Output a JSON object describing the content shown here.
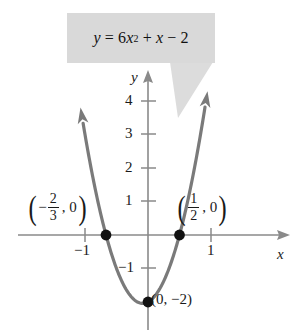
{
  "figure": {
    "equation_label": {
      "lhs": "y",
      "equals": "=",
      "coefficient": "6",
      "variable": "x",
      "exponent": "2",
      "plus": "+",
      "linear_term": "x",
      "minus": "−",
      "constant": "2",
      "full_text": "y = 6x² + x − 2",
      "box_color": "#d9d9d9"
    },
    "axes": {
      "x_axis_name": "x",
      "y_axis_name": "y",
      "x_ticks": [
        {
          "label": "−1",
          "value": -1
        },
        {
          "label": "1",
          "value": 1
        }
      ],
      "y_ticks": [
        {
          "label": "4",
          "value": 4
        },
        {
          "label": "3",
          "value": 3
        },
        {
          "label": "2",
          "value": 2
        },
        {
          "label": "1",
          "value": 1
        },
        {
          "label": "−1",
          "value": -1
        }
      ],
      "axis_color": "#8a8a8a"
    },
    "points": [
      {
        "name": "left-x-intercept",
        "label_text": "(−2/3, 0)",
        "neg": "−",
        "numerator": "2",
        "denominator": "3",
        "second_coord": "0",
        "x": -0.6667,
        "y": 0
      },
      {
        "name": "right-x-intercept",
        "label_text": "(1/2, 0)",
        "numerator": "1",
        "denominator": "2",
        "second_coord": "0",
        "x": 0.5,
        "y": 0
      },
      {
        "name": "y-intercept",
        "label_text": "(0, −2)",
        "x": 0,
        "y": -2
      }
    ]
  },
  "chart_data": {
    "type": "line",
    "xlabel": "x",
    "ylabel": "y",
    "xlim": [
      -1.4,
      1.35
    ],
    "ylim": [
      -2.6,
      4.9
    ],
    "grid": false,
    "legend": null,
    "series": [
      {
        "name": "y = 6x^2 + x - 2",
        "equation": "y = 6x^2 + x - 2",
        "color": "#7a7a7a",
        "x": [
          -1.05,
          -0.95,
          -0.85,
          -0.75,
          -0.6667,
          -0.55,
          -0.45,
          -0.35,
          -0.25,
          -0.1667,
          -0.0833,
          0,
          0.0833,
          0.1667,
          0.25,
          0.35,
          0.45,
          0.5,
          0.6,
          0.7,
          0.8,
          0.9,
          1.0
        ],
        "y": [
          3.565,
          2.365,
          1.485,
          0.625,
          0.0,
          -0.735,
          -1.235,
          -1.615,
          -1.875,
          -2.0,
          -1.041,
          -2.0,
          -1.875,
          -1.667,
          -1.375,
          -0.615,
          -0.235,
          0.0,
          0.76,
          1.64,
          2.64,
          3.76,
          5.0
        ]
      }
    ],
    "annotated_points": [
      {
        "label": "(−2/3, 0)",
        "x": -0.6667,
        "y": 0
      },
      {
        "label": "(1/2, 0)",
        "x": 0.5,
        "y": 0
      },
      {
        "label": "(0, −2)",
        "x": 0,
        "y": -2
      }
    ],
    "x_ticks": [
      -1,
      1
    ],
    "y_ticks": [
      -1,
      1,
      2,
      3,
      4
    ],
    "vertex": {
      "x": -0.0833,
      "y": -2.0417
    },
    "roots": [
      -0.6667,
      0.5
    ]
  }
}
